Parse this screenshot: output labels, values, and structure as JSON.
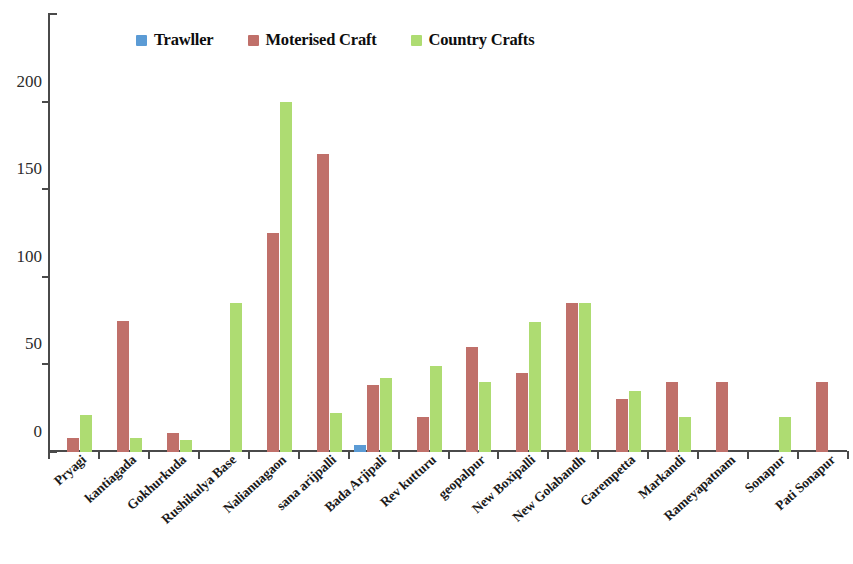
{
  "chart_data": {
    "type": "bar",
    "title": "",
    "subtitle": "",
    "xlabel": "",
    "ylabel": "",
    "ylim": [
      0,
      250
    ],
    "yticks": [
      0,
      50,
      100,
      150,
      200,
      250
    ],
    "grid": false,
    "legend_position": "top-center",
    "categories": [
      "Pryagi",
      "kantiagada",
      "Gokhurkuda",
      "Rushikulya Base",
      "Nalianuagaon",
      "sana arijpalli",
      "Bada Arjipali",
      "Rev kutturu",
      "geopalpur",
      "New Boxipalli",
      "New Golabandh",
      "Garempetta",
      "Markandi",
      "Rameyapatnam",
      "Sonapur",
      "Pati Sonapur"
    ],
    "series": [
      {
        "name": "Trawller",
        "color": "#5B9BD5",
        "values": [
          0,
          0,
          0,
          0,
          0,
          0,
          4,
          0,
          0,
          0,
          0,
          0,
          0,
          0,
          0,
          0
        ]
      },
      {
        "name": "Moterised Craft",
        "color": "#C0706A",
        "values": [
          8,
          75,
          11,
          0,
          125,
          170,
          38,
          20,
          60,
          45,
          85,
          30,
          40,
          40,
          0,
          40
        ]
      },
      {
        "name": "Country Crafts",
        "color": "#AEDC72",
        "values": [
          21,
          8,
          7,
          85,
          200,
          22,
          42,
          49,
          40,
          74,
          85,
          35,
          20,
          0,
          20,
          0
        ]
      }
    ]
  },
  "legend": {
    "items": [
      {
        "label": "Trawller",
        "color": "#5B9BD5"
      },
      {
        "label": "Moterised Craft",
        "color": "#C0706A"
      },
      {
        "label": "Country Crafts",
        "color": "#AEDC72"
      }
    ]
  }
}
